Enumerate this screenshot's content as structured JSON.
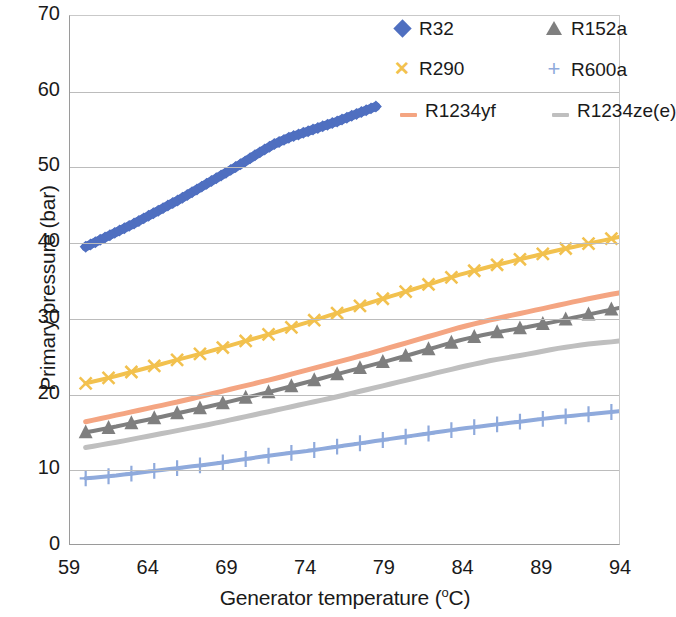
{
  "chart_data": {
    "type": "line",
    "title": "",
    "xlabel": "Generator temperature (°C)",
    "ylabel": "Primary pressure (bar)",
    "xlim": [
      59,
      94
    ],
    "ylim": [
      0,
      70
    ],
    "xticks": [
      59,
      64,
      69,
      74,
      79,
      84,
      89,
      94
    ],
    "yticks": [
      0,
      10,
      20,
      30,
      40,
      50,
      60,
      70
    ],
    "grid": "horizontal",
    "legend_position": "top-right",
    "legend_columns": 2,
    "series": [
      {
        "name": "R32",
        "color": "#4F6FC0",
        "marker": "diamond",
        "x": [
          60,
          61,
          62,
          63,
          64,
          65,
          66,
          67,
          68,
          69,
          70,
          71,
          72,
          73,
          74,
          75,
          76,
          77,
          78,
          78.5
        ],
        "values": [
          39.4,
          40.4,
          41.4,
          42.4,
          43.5,
          44.6,
          45.7,
          46.9,
          48.1,
          49.3,
          50.5,
          51.8,
          53.0,
          53.9,
          54.6,
          55.3,
          56.0,
          56.8,
          57.6,
          58.0
        ]
      },
      {
        "name": "R152a",
        "color": "#7F7F7F",
        "marker": "triangle",
        "x": [
          60,
          62,
          64,
          66,
          68,
          70,
          72,
          74,
          76,
          78,
          80,
          82,
          84,
          86,
          88,
          90,
          92,
          94
        ],
        "values": [
          14.8,
          15.6,
          16.5,
          17.4,
          18.3,
          19.3,
          20.3,
          21.4,
          22.5,
          23.6,
          24.7,
          25.9,
          27.1,
          28.0,
          28.7,
          29.5,
          30.4,
          31.3
        ]
      },
      {
        "name": "R290",
        "color": "#F2C14E",
        "marker": "x",
        "x": [
          60,
          62,
          64,
          66,
          68,
          70,
          72,
          74,
          76,
          78,
          80,
          82,
          84,
          86,
          88,
          90,
          92,
          94
        ],
        "values": [
          21.3,
          22.3,
          23.4,
          24.5,
          25.6,
          26.8,
          28.0,
          29.3,
          30.6,
          31.9,
          33.2,
          34.5,
          35.8,
          36.9,
          37.9,
          38.9,
          39.8,
          40.7
        ]
      },
      {
        "name": "R600a",
        "color": "#8FAADC",
        "marker": "plus",
        "x": [
          60,
          62,
          64,
          66,
          68,
          70,
          72,
          74,
          76,
          78,
          80,
          82,
          84,
          86,
          88,
          90,
          92,
          94
        ],
        "values": [
          8.7,
          9.1,
          9.6,
          10.1,
          10.6,
          11.2,
          11.8,
          12.3,
          12.9,
          13.5,
          14.1,
          14.7,
          15.3,
          15.8,
          16.3,
          16.8,
          17.2,
          17.6
        ]
      },
      {
        "name": "R1234yf",
        "color": "#F4A582",
        "marker": "line",
        "x": [
          60,
          62,
          64,
          66,
          68,
          70,
          72,
          74,
          76,
          78,
          80,
          82,
          84,
          86,
          88,
          90,
          92,
          94
        ],
        "values": [
          16.2,
          17.1,
          18.0,
          18.9,
          19.9,
          20.9,
          21.9,
          23.0,
          24.1,
          25.2,
          26.4,
          27.6,
          28.8,
          29.8,
          30.7,
          31.6,
          32.5,
          33.3
        ]
      },
      {
        "name": "R1234ze(e)",
        "color": "#BFBFBF",
        "marker": "line",
        "x": [
          60,
          62,
          64,
          66,
          68,
          70,
          72,
          74,
          76,
          78,
          80,
          82,
          84,
          86,
          88,
          90,
          92,
          94
        ],
        "values": [
          12.8,
          13.5,
          14.3,
          15.1,
          15.9,
          16.8,
          17.7,
          18.6,
          19.5,
          20.5,
          21.5,
          22.5,
          23.5,
          24.4,
          25.1,
          25.9,
          26.5,
          26.9
        ]
      }
    ]
  },
  "axes": {
    "y_title_main": "Primary pressure (bar)",
    "x_title_main": "Generator temperature (",
    "x_title_unit": "o",
    "x_title_tail": "C)",
    "y_tick_labels": [
      "70",
      "60",
      "50",
      "40",
      "30",
      "20",
      "10",
      "0"
    ],
    "x_tick_labels": [
      "59",
      "64",
      "69",
      "74",
      "79",
      "84",
      "89",
      "94"
    ]
  },
  "legend": {
    "items": [
      {
        "label": "R32",
        "color": "#4F6FC0",
        "marker": "diamond"
      },
      {
        "label": "R152a",
        "color": "#7F7F7F",
        "marker": "triangle"
      },
      {
        "label": "R290",
        "color": "#F2C14E",
        "marker": "x"
      },
      {
        "label": "R600a",
        "color": "#8FAADC",
        "marker": "plus"
      },
      {
        "label": "R1234yf",
        "color": "#F4A582",
        "marker": "line"
      },
      {
        "label": "R1234ze(e)",
        "color": "#BFBFBF",
        "marker": "line"
      }
    ]
  }
}
